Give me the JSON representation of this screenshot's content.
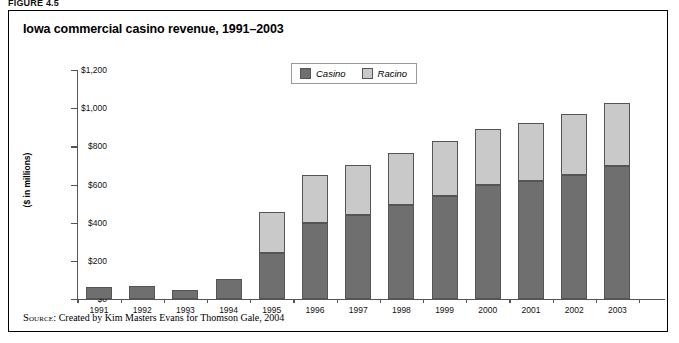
{
  "figure_label": "FIGURE 4.5",
  "chart_title": "Iowa commercial casino revenue, 1991–2003",
  "source": {
    "kicker": "Source:",
    "text": " Created by Kim Masters Evans for Thomson Gale, 2004"
  },
  "legend": {
    "items": [
      {
        "label": "Casino",
        "color": "#6f6f6f"
      },
      {
        "label": "Racino",
        "color": "#c9c9c9"
      }
    ]
  },
  "chart_data": {
    "type": "bar",
    "stacked": true,
    "title": "Iowa commercial casino revenue, 1991–2003",
    "xlabel": "",
    "ylabel": "($ in millions)",
    "ylim": [
      0,
      1200
    ],
    "yticks": [
      0,
      200,
      400,
      600,
      800,
      1000,
      1200
    ],
    "ytick_labels": [
      "$0",
      "$200",
      "$400",
      "$600",
      "$800",
      "$1,000",
      "$1,200"
    ],
    "grid": false,
    "legend_position": "top-center",
    "categories": [
      "1991",
      "1992",
      "1993",
      "1994",
      "1995",
      "1996",
      "1997",
      "1998",
      "1999",
      "2000",
      "2001",
      "2002",
      "2003"
    ],
    "series": [
      {
        "name": "Casino",
        "color": "#6f6f6f",
        "values": [
          63,
          70,
          45,
          105,
          243,
          400,
          440,
          495,
          540,
          598,
          620,
          652,
          698
        ]
      },
      {
        "name": "Racino",
        "color": "#c9c9c9",
        "values": [
          0,
          0,
          0,
          0,
          212,
          252,
          260,
          272,
          290,
          292,
          300,
          320,
          328
        ]
      }
    ],
    "totals": [
      63,
      70,
      45,
      105,
      455,
      652,
      700,
      767,
      830,
      890,
      920,
      972,
      1026
    ]
  }
}
